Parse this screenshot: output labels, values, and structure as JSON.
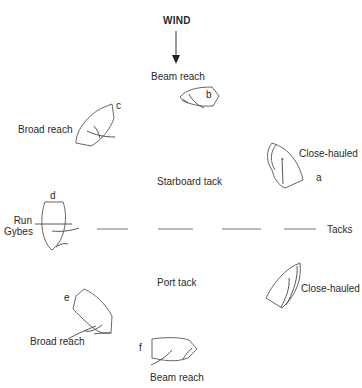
{
  "diagram": {
    "wind_label": "WIND",
    "tacks_label": "Tacks",
    "starboard_tack_label": "Starboard tack",
    "port_tack_label": "Port tack",
    "boats": [
      {
        "id": "a",
        "letter": "a",
        "label": "Close-hauled",
        "tack": "Starboard tack"
      },
      {
        "id": "b",
        "letter": "b",
        "label": "Beam reach",
        "tack": "Starboard tack"
      },
      {
        "id": "c",
        "letter": "c",
        "label": "Broad reach",
        "tack": "Starboard tack"
      },
      {
        "id": "d",
        "letter": "d",
        "label_line1": "Run",
        "label_line2": "Gybes"
      },
      {
        "id": "e",
        "letter": "e",
        "label": "Broad reach",
        "tack": "Port tack"
      },
      {
        "id": "f",
        "letter": "f",
        "label": "Beam reach",
        "tack": "Port tack"
      },
      {
        "id": "g",
        "letter": "",
        "label": "Close-hauled",
        "tack": "Port tack"
      }
    ]
  }
}
